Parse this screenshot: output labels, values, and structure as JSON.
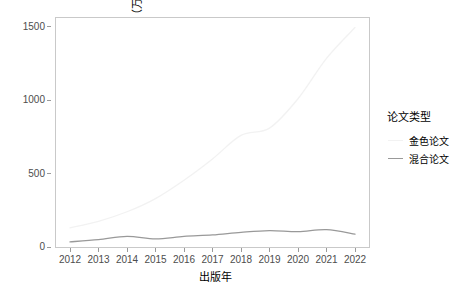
{
  "chart_data": {
    "type": "line",
    "title": "",
    "xlabel": "出版年",
    "ylabel": "APC费用（万元）",
    "categories": [
      "2012",
      "2013",
      "2014",
      "2015",
      "2016",
      "2017",
      "2018",
      "2019",
      "2020",
      "2021",
      "2022"
    ],
    "x": [
      2012,
      2013,
      2014,
      2015,
      2016,
      2017,
      2018,
      2019,
      2020,
      2021,
      2022
    ],
    "xlim": [
      2012,
      2022
    ],
    "ylim": [
      0,
      1560
    ],
    "yticks": [
      0,
      500,
      1000,
      1500
    ],
    "ytick_labels": [
      "0",
      "500",
      "1000",
      "1500"
    ],
    "grid": false,
    "legend_title": "论文类型",
    "legend_position": "right",
    "series": [
      {
        "name": "金色论文",
        "color": "#f2f2f2",
        "values": [
          130,
          175,
          240,
          330,
          455,
          600,
          760,
          810,
          1010,
          1285,
          1495
        ]
      },
      {
        "name": "混合论文",
        "color": "#999999",
        "values": [
          35,
          50,
          72,
          55,
          72,
          82,
          100,
          112,
          105,
          118,
          88
        ]
      }
    ]
  },
  "axis": {
    "x_title": "出版年",
    "y_title": "APC费用（万元）"
  },
  "legend": {
    "title": "论文类型",
    "items": [
      {
        "label": "金色论文",
        "color": "#f2f2f2"
      },
      {
        "label": "混合论文",
        "color": "#999999"
      }
    ]
  },
  "colors": {
    "panel_border": "#c9c9c9",
    "tick_text": "#4d4d4d",
    "tick_mark": "#9a9a9a",
    "background": "#ffffff"
  }
}
